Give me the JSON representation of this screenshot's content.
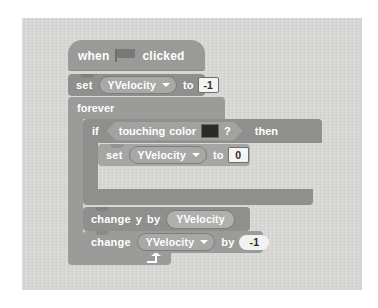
{
  "app": {
    "name": "Scratch",
    "view": "scripts-canvas",
    "canvas_background": "#d6d6d4"
  },
  "script": {
    "blocks": [
      {
        "id": "hat",
        "type": "hat",
        "words": {
          "when": "when",
          "clicked": "clicked"
        },
        "icon": "green-flag-icon"
      },
      {
        "id": "set-yvelocity-outer",
        "type": "stack",
        "words": {
          "set": "set",
          "to": "to"
        },
        "variable": "YVelocity",
        "value": "-1"
      },
      {
        "id": "forever",
        "type": "c-block",
        "label": "forever",
        "loop_arrow": "loop-arrow-icon"
      },
      {
        "id": "if-then",
        "type": "c-block",
        "label_if": "if",
        "label_then": "then",
        "condition": {
          "type": "boolean",
          "words": {
            "touching": "touching",
            "color": "color",
            "question": "?"
          },
          "color_swatch": "#2a2a28"
        }
      },
      {
        "id": "set-yvelocity-inner",
        "type": "stack",
        "words": {
          "set": "set",
          "to": "to"
        },
        "variable": "YVelocity",
        "value": "0"
      },
      {
        "id": "change-y-by",
        "type": "stack",
        "words": {
          "change": "change",
          "y": "y",
          "by": "by"
        },
        "reporter": "YVelocity"
      },
      {
        "id": "change-yvelocity-by",
        "type": "stack",
        "words": {
          "change": "change",
          "by": "by"
        },
        "variable": "YVelocity",
        "value": "-1"
      }
    ]
  },
  "colors": {
    "block_gray_dark": "#8f8f8d",
    "block_gray_mid": "#9b9b99",
    "block_gray_light": "#a5a5a3",
    "canvas": "#d6d6d4",
    "field_white": "#f4f4f2",
    "color_swatch": "#2a2a28"
  }
}
